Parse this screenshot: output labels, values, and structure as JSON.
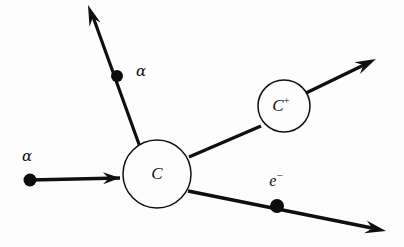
{
  "figure": {
    "type": "physics-scattering-diagram",
    "background_color": "#fdfdfd",
    "ink_color": "#100f0f",
    "width": 404,
    "height": 247
  },
  "nodes": [
    {
      "id": "target-atom",
      "label": "C",
      "charge": "",
      "cx": 157,
      "cy": 174,
      "r": 34,
      "label_x": 157,
      "label_y": 175,
      "font_size": 17
    },
    {
      "id": "product-ion",
      "label": "C",
      "charge": "+",
      "cx": 284,
      "cy": 106,
      "r": 26,
      "label_x": 281,
      "label_y": 107,
      "font_size": 16
    }
  ],
  "tracks": [
    {
      "id": "incident-alpha",
      "label": "α",
      "label_x": 27,
      "label_y": 157,
      "stroke_width": 3.4,
      "path": "M 30 180 L 120 178",
      "arrow": {
        "tip_x": 120,
        "tip_y": 178,
        "angle_deg": -1,
        "length": 17,
        "half_width": 6
      },
      "dot": {
        "cx": 30,
        "cy": 180,
        "r": 6.5
      }
    },
    {
      "id": "scattered-alpha",
      "label": "α",
      "label_x": 141,
      "label_y": 72,
      "stroke_width": 3.2,
      "path": "M 140 147 L 92 14",
      "arrow": {
        "tip_x": 88,
        "tip_y": 5,
        "angle_deg": -109.8,
        "length": 21,
        "half_width": 6
      },
      "dot": {
        "cx": 117,
        "cy": 76,
        "r": 6
      }
    },
    {
      "id": "ion-recoil-in",
      "label": "",
      "label_x": 0,
      "label_y": 0,
      "stroke_width": 3.4,
      "path": "M 189 157 L 261 126",
      "arrow": null,
      "dot": null
    },
    {
      "id": "ion-recoil-out",
      "label": "",
      "label_x": 0,
      "label_y": 0,
      "stroke_width": 3.4,
      "path": "M 306 93 L 368 63",
      "arrow": {
        "tip_x": 376,
        "tip_y": 59,
        "angle_deg": -25.8,
        "length": 21,
        "half_width": 6.5
      },
      "dot": null
    },
    {
      "id": "ejected-electron",
      "label": "e",
      "charge": "−",
      "label_x": 276,
      "label_y": 182,
      "stroke_width": 3.4,
      "path": "M 188 191 L 377 229",
      "arrow": {
        "tip_x": 386,
        "tip_y": 231,
        "angle_deg": 11.4,
        "length": 21,
        "half_width": 6.5
      },
      "dot": {
        "cx": 277,
        "cy": 206,
        "r": 7
      }
    }
  ]
}
